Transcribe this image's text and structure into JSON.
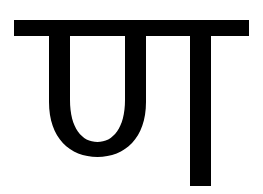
{
  "image": {
    "description": "Single Devanagari-style glyph rendered in black on white",
    "glyph_text": "पा",
    "colors": {
      "background": "#ffffff",
      "foreground": "#000000"
    }
  }
}
